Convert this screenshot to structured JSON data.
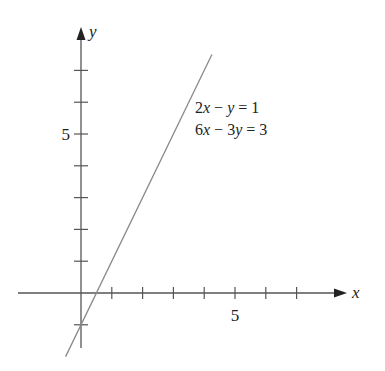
{
  "chart_data": {
    "type": "line",
    "title": "",
    "xlabel": "x",
    "ylabel": "y",
    "xlim": [
      -2,
      8.5
    ],
    "ylim": [
      -2,
      8.3
    ],
    "grid": false,
    "x_ticks": [
      1,
      2,
      3,
      4,
      5,
      6,
      7
    ],
    "x_tick_labels": [
      {
        "value": 5,
        "label": "5"
      }
    ],
    "y_ticks": [
      -1,
      1,
      2,
      3,
      4,
      5,
      6,
      7
    ],
    "y_tick_labels": [
      {
        "value": 5,
        "label": "5"
      }
    ],
    "series": [
      {
        "name": "2x − y = 1 / 6x − 3y = 3",
        "equation": "y = 2x − 1",
        "x": [
          -0.5,
          4.25
        ],
        "y": [
          -2,
          7.5
        ],
        "color": "#8a8a8a"
      }
    ],
    "annotations": [
      {
        "text": "2x − y = 1",
        "x": 3.7,
        "y": 5.7
      },
      {
        "text": "6x − 3y = 3",
        "x": 3.7,
        "y": 5.0
      }
    ]
  },
  "labels": {
    "x_axis": "x",
    "y_axis": "y",
    "x_tick_5": "5",
    "y_tick_5": "5",
    "eq1": {
      "coef1": "2",
      "var1": "x",
      "op": " − ",
      "coef2": "",
      "var2": "y",
      "rhs": " = 1"
    },
    "eq2": {
      "coef1": "6",
      "var1": "x",
      "op": " − ",
      "coef2": "3",
      "var2": "y",
      "rhs": " = 3"
    }
  },
  "colors": {
    "axis": "#555555",
    "line": "#8a8a8a",
    "text": "#222222"
  }
}
